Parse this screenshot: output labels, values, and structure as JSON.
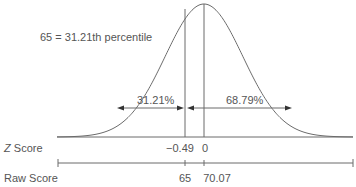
{
  "chart_data": {
    "type": "area",
    "title": "",
    "annotation": "65 = 31.21th percentile",
    "distribution": "normal",
    "mean_raw": 70.07,
    "observed_raw": 65,
    "z_observed": -0.49,
    "regions": [
      {
        "label": "31.21%",
        "side": "left",
        "value": 31.21
      },
      {
        "label": "68.79%",
        "side": "right",
        "value": 68.79
      }
    ],
    "axes": [
      {
        "name": "Z Score",
        "ticks": [
          {
            "label": "-0.49",
            "value": -0.49
          },
          {
            "label": "0",
            "value": 0
          }
        ]
      },
      {
        "name": "Raw Score",
        "ticks": [
          {
            "label": "65",
            "value": 65
          },
          {
            "label": "70.07",
            "value": 70.07
          }
        ]
      }
    ],
    "grid": false,
    "legend": "none"
  },
  "labels": {
    "annotation": "65 = 31.21th percentile",
    "left_pct": "31.21%",
    "right_pct": "68.79%",
    "z_axis_italic": "Z",
    "z_axis_rest": " Score",
    "raw_axis": "Raw Score",
    "z_tick_obs": "−0.49",
    "z_tick_mean": "0",
    "raw_tick_obs": "65",
    "raw_tick_mean": "70.07"
  },
  "colors": {
    "line": "#6b6b6b",
    "text": "#555555"
  }
}
